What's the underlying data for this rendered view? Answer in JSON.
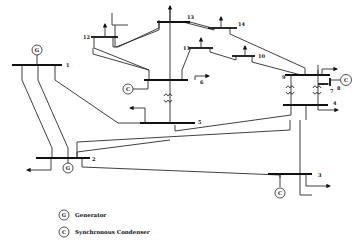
{
  "diagram": {
    "title": "",
    "buses": [
      {
        "id": "1",
        "label": "1"
      },
      {
        "id": "2",
        "label": "2"
      },
      {
        "id": "3",
        "label": "3"
      },
      {
        "id": "4",
        "label": "4"
      },
      {
        "id": "5",
        "label": "5"
      },
      {
        "id": "6",
        "label": "6"
      },
      {
        "id": "7",
        "label": "7"
      },
      {
        "id": "8",
        "label": "8"
      },
      {
        "id": "9",
        "label": "9"
      },
      {
        "id": "10",
        "label": "10"
      },
      {
        "id": "11",
        "label": "11"
      },
      {
        "id": "12",
        "label": "12"
      },
      {
        "id": "13",
        "label": "13"
      },
      {
        "id": "14",
        "label": "14"
      }
    ],
    "symbols": {
      "generator": "G",
      "condenser": "C"
    },
    "legend": [
      {
        "symbol": "G",
        "label": "Generator"
      },
      {
        "symbol": "C",
        "label": "Synchronous Condenser"
      }
    ]
  }
}
